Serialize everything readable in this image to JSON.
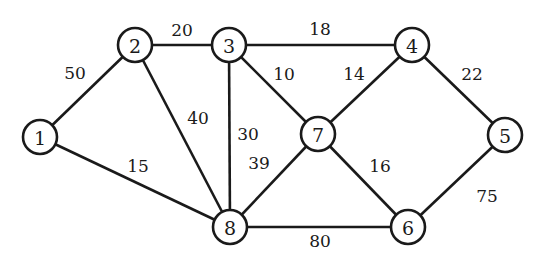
{
  "graph": {
    "type": "weighted-undirected-graph",
    "node_radius": 17,
    "colors": {
      "stroke": "#1a1a1a",
      "fill": "#ffffff",
      "background": "#ffffff"
    },
    "nodes": [
      {
        "id": "1",
        "label": "1",
        "x": 40,
        "y": 137
      },
      {
        "id": "2",
        "label": "2",
        "x": 135,
        "y": 45
      },
      {
        "id": "3",
        "label": "3",
        "x": 229,
        "y": 45
      },
      {
        "id": "4",
        "label": "4",
        "x": 412,
        "y": 45
      },
      {
        "id": "5",
        "label": "5",
        "x": 505,
        "y": 135
      },
      {
        "id": "6",
        "label": "6",
        "x": 408,
        "y": 227
      },
      {
        "id": "7",
        "label": "7",
        "x": 318,
        "y": 134
      },
      {
        "id": "8",
        "label": "8",
        "x": 230,
        "y": 227
      }
    ],
    "edges": [
      {
        "from": "1",
        "to": "2",
        "weight": "50",
        "lx": 75,
        "ly": 73
      },
      {
        "from": "1",
        "to": "8",
        "weight": "15",
        "lx": 138,
        "ly": 166
      },
      {
        "from": "2",
        "to": "3",
        "weight": "20",
        "lx": 182,
        "ly": 30
      },
      {
        "from": "2",
        "to": "8",
        "weight": "40",
        "lx": 198,
        "ly": 118
      },
      {
        "from": "3",
        "to": "4",
        "weight": "18",
        "lx": 320,
        "ly": 29
      },
      {
        "from": "3",
        "to": "7",
        "weight": "10",
        "lx": 284,
        "ly": 74
      },
      {
        "from": "3",
        "to": "8",
        "weight": "30",
        "lx": 248,
        "ly": 134
      },
      {
        "from": "4",
        "to": "7",
        "weight": "14",
        "lx": 354,
        "ly": 74
      },
      {
        "from": "4",
        "to": "5",
        "weight": "22",
        "lx": 472,
        "ly": 74
      },
      {
        "from": "5",
        "to": "6",
        "weight": "75",
        "lx": 487,
        "ly": 196
      },
      {
        "from": "7",
        "to": "6",
        "weight": "16",
        "lx": 380,
        "ly": 166
      },
      {
        "from": "7",
        "to": "8",
        "weight": "39",
        "lx": 259,
        "ly": 163
      },
      {
        "from": "8",
        "to": "6",
        "weight": "80",
        "lx": 320,
        "ly": 241
      }
    ]
  }
}
